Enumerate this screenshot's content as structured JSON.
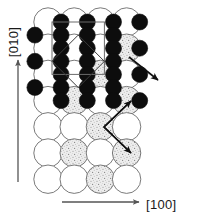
{
  "figure": {
    "type": "crystal-structure-projection",
    "title": "",
    "background_color": "#ffffff"
  },
  "axes": {
    "vertical": {
      "label": "[010]",
      "direction": "up",
      "arrow_color": "#555555",
      "label_rotation_deg": -90,
      "x": 18,
      "arrow_top_y": 60,
      "arrow_bottom_y": 182,
      "label_x": 18,
      "label_y": 42
    },
    "horizontal": {
      "label": "[100]",
      "direction": "right",
      "arrow_color": "#555555",
      "arrow_left_x": 62,
      "arrow_right_x": 139,
      "y": 202,
      "label_x": 146,
      "label_y": 206
    }
  },
  "lattice": {
    "origin_x": 48,
    "origin_y": 22,
    "spacing": 26.2,
    "columns": 6,
    "rows": 7,
    "large_circle_radius": 14.2,
    "small_circle_radius": 8.0,
    "large_circle_stroke": "#6b6b6b",
    "large_circle_stroke_width": 0.9,
    "large_circle_fill_open": "#ffffff",
    "large_circle_fill_shaded": "#e2e2e2",
    "small_circle_fill": "#0d0d0d",
    "small_circle_stroke": "#0d0d0d"
  },
  "large_circles": [
    {
      "col": 0,
      "row": 0,
      "fill": "open"
    },
    {
      "col": 1,
      "row": 0,
      "fill": "open"
    },
    {
      "col": 2,
      "row": 0,
      "fill": "open"
    },
    {
      "col": 3,
      "row": 0,
      "fill": "open"
    },
    {
      "col": 0,
      "row": 1,
      "fill": "open"
    },
    {
      "col": 1,
      "row": 1,
      "fill": "open"
    },
    {
      "col": 2,
      "row": 1,
      "fill": "open"
    },
    {
      "col": 3,
      "row": 1,
      "fill": "shaded"
    },
    {
      "col": 0,
      "row": 2,
      "fill": "open"
    },
    {
      "col": 1,
      "row": 2,
      "fill": "open"
    },
    {
      "col": 2,
      "row": 2,
      "fill": "shaded"
    },
    {
      "col": 3,
      "row": 2,
      "fill": "open"
    },
    {
      "col": 0,
      "row": 3,
      "fill": "open"
    },
    {
      "col": 1,
      "row": 3,
      "fill": "shaded"
    },
    {
      "col": 2,
      "row": 3,
      "fill": "open"
    },
    {
      "col": 3,
      "row": 3,
      "fill": "shaded"
    },
    {
      "col": 0,
      "row": 4,
      "fill": "open"
    },
    {
      "col": 1,
      "row": 4,
      "fill": "open"
    },
    {
      "col": 2,
      "row": 4,
      "fill": "shaded"
    },
    {
      "col": 3,
      "row": 4,
      "fill": "open"
    },
    {
      "col": 0,
      "row": 5,
      "fill": "open"
    },
    {
      "col": 1,
      "row": 5,
      "fill": "shaded"
    },
    {
      "col": 2,
      "row": 5,
      "fill": "open"
    },
    {
      "col": 3,
      "row": 5,
      "fill": "shaded"
    },
    {
      "col": 0,
      "row": 6,
      "fill": "open"
    },
    {
      "col": 1,
      "row": 6,
      "fill": "open"
    },
    {
      "col": 2,
      "row": 6,
      "fill": "shaded"
    },
    {
      "col": 3,
      "row": 6,
      "fill": "open"
    }
  ],
  "small_circles": [
    {
      "col": 0.5,
      "row": 0
    },
    {
      "col": 1.5,
      "row": 0
    },
    {
      "col": 2.5,
      "row": 0
    },
    {
      "col": 3.5,
      "row": 0
    },
    {
      "col": -0.5,
      "row": 0.5
    },
    {
      "col": 0.5,
      "row": 0.5
    },
    {
      "col": 1.5,
      "row": 0.5
    },
    {
      "col": 2.5,
      "row": 0.5
    },
    {
      "col": 0.5,
      "row": 1
    },
    {
      "col": 1.5,
      "row": 1
    },
    {
      "col": 2.5,
      "row": 1
    },
    {
      "col": 3.5,
      "row": 1
    },
    {
      "col": -0.5,
      "row": 1.5
    },
    {
      "col": 0.5,
      "row": 1.5
    },
    {
      "col": 1.5,
      "row": 1.5
    },
    {
      "col": 2.5,
      "row": 1.5
    },
    {
      "col": 0.5,
      "row": 2
    },
    {
      "col": 1.5,
      "row": 2
    },
    {
      "col": 2.5,
      "row": 2
    },
    {
      "col": 3.5,
      "row": 2
    },
    {
      "col": -0.5,
      "row": 2.5
    },
    {
      "col": 0.5,
      "row": 2.5
    },
    {
      "col": 1.5,
      "row": 2.5
    },
    {
      "col": 2.5,
      "row": 2.5
    },
    {
      "col": 0.5,
      "row": 3
    },
    {
      "col": 1.5,
      "row": 3
    },
    {
      "col": 2.5,
      "row": 3
    },
    {
      "col": 3.5,
      "row": 3
    }
  ],
  "unit_cell": {
    "square": {
      "x": 52,
      "y": 22,
      "size": 52.4,
      "stroke": "#6b6b6b",
      "stroke_width": 1.0,
      "fill": "none"
    },
    "diamond": {
      "center_x": 78.2,
      "center_y": 61.3,
      "half_diagonal": 26.2,
      "stroke": "#3a3a3a",
      "stroke_width": 1.0,
      "fill": "none"
    }
  },
  "arrows": [
    {
      "name": "displacement-arrow-upper",
      "x1": 129,
      "y1": 57,
      "x2": 158,
      "y2": 80,
      "color": "#101010",
      "width": 1.6
    },
    {
      "name": "displacement-arrow-branch-up",
      "x1": 104,
      "y1": 127,
      "x2": 131,
      "y2": 101,
      "color": "#101010",
      "width": 1.6
    },
    {
      "name": "displacement-arrow-branch-down",
      "x1": 104,
      "y1": 127,
      "x2": 131,
      "y2": 153,
      "color": "#101010",
      "width": 1.6
    }
  ],
  "arrow_vertex_connector": {
    "name": "arrow-vertex-connector",
    "points": "131,101 104,127 131,153",
    "color": "#101010",
    "width": 1.6
  },
  "chart_data": {
    "type": "scatter",
    "xlabel": "[100]",
    "ylabel": "[010]",
    "legend": [],
    "annotations": [
      "[010]",
      "[100]"
    ],
    "series": [
      {
        "name": "large-open-atoms",
        "marker": "open-circle",
        "count": 18
      },
      {
        "name": "large-shaded-atoms",
        "marker": "shaded-circle",
        "count": 10
      },
      {
        "name": "small-filled-atoms",
        "marker": "filled-circle",
        "count": 28
      }
    ]
  }
}
